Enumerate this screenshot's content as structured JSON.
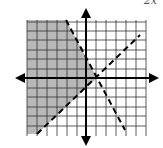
{
  "figure": {
    "type": "inequality-graph",
    "corner_label": "2x",
    "grid": {
      "x_min": -6,
      "x_max": 6,
      "y_min": -6,
      "y_max": 6,
      "cell_px": 10
    },
    "colors": {
      "shade": "#b8b8b8",
      "grid": "#333333",
      "axis": "#000000",
      "background": "#ffffff"
    },
    "lines": [
      {
        "name": "descending-boundary",
        "style": "dashed",
        "from": [
          -2,
          6
        ],
        "to": [
          4,
          -5
        ]
      },
      {
        "name": "ascending-boundary",
        "style": "dashed",
        "from": [
          -5,
          -5.5
        ],
        "to": [
          5.5,
          4.5
        ]
      }
    ],
    "shaded_region": "left of descending line and above ascending line"
  }
}
